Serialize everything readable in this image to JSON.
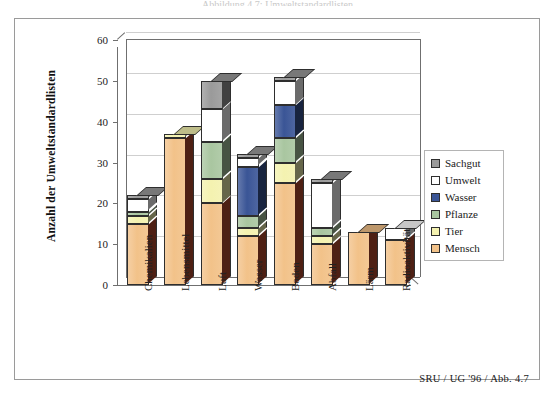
{
  "figure": {
    "caption_clipped": "Abbildung 4.7: Umweltstandardlisten",
    "source_note": "SRU / UG '96 / Abb. 4.7"
  },
  "chart_data": {
    "type": "bar",
    "stacked": true,
    "title": "",
    "xlabel": "",
    "ylabel": "Anzahl der Umweltstandardlisten",
    "ylim": [
      0,
      60
    ],
    "yticks": [
      0,
      10,
      20,
      30,
      40,
      50,
      60
    ],
    "grid": true,
    "legend_position": "right",
    "categories": [
      "Chemikalien",
      "Lebensmittel",
      "Luft",
      "Wasser",
      "Boden",
      "Abfall",
      "Lärm",
      "Radioaktivität"
    ],
    "series": [
      {
        "name": "Mensch",
        "color": "#F2C289",
        "values": [
          15,
          36,
          20,
          12,
          25,
          10,
          13,
          11
        ]
      },
      {
        "name": "Tier",
        "color": "#F4F2B0",
        "values": [
          2,
          1,
          6,
          2,
          5,
          2,
          0,
          0
        ]
      },
      {
        "name": "Pflanze",
        "color": "#A9C6A0",
        "values": [
          1,
          0,
          9,
          3,
          6,
          2,
          0,
          0
        ]
      },
      {
        "name": "Wasser",
        "color": "#3A5596",
        "values": [
          0,
          0,
          0,
          12,
          8,
          0,
          0,
          0
        ]
      },
      {
        "name": "Umwelt",
        "color": "#FFFFFF",
        "values": [
          3,
          0,
          8,
          2,
          6,
          11,
          0,
          3
        ]
      },
      {
        "name": "Sachgut",
        "color": "#9A9A9A",
        "values": [
          1,
          0,
          7,
          1,
          1,
          1,
          0,
          0
        ]
      }
    ],
    "totals": [
      22,
      37,
      50,
      32,
      51,
      26,
      13,
      14
    ],
    "legend": [
      {
        "label": "Sachgut",
        "color": "#9A9A9A"
      },
      {
        "label": "Umwelt",
        "color": "#FFFFFF"
      },
      {
        "label": "Wasser",
        "color": "#3A5596"
      },
      {
        "label": "Pflanze",
        "color": "#A9C6A0"
      },
      {
        "label": "Tier",
        "color": "#F4F2B0"
      },
      {
        "label": "Mensch",
        "color": "#F2C289"
      }
    ]
  }
}
